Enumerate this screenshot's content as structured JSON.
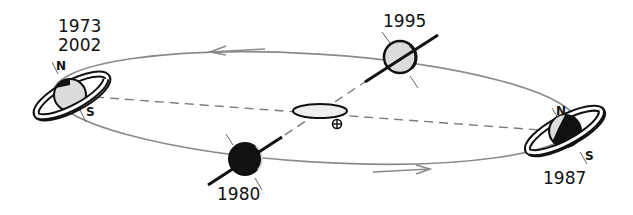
{
  "diagram": {
    "title": "",
    "colors": {
      "background": "#ffffff",
      "orbit": "#8a8a8a",
      "ink": "#111111",
      "planet_light": "#dcdcdc",
      "dash": "#7a7a7a"
    },
    "positions": [
      {
        "id": "left",
        "years": [
          "1973",
          "2002"
        ],
        "north_label": "N",
        "south_label": "S",
        "rings": "open"
      },
      {
        "id": "top",
        "years": [
          "1995"
        ],
        "rings": "edge-on"
      },
      {
        "id": "right",
        "years": [
          "1987"
        ],
        "north_label": "N",
        "south_label": "S",
        "rings": "open"
      },
      {
        "id": "bottom",
        "years": [
          "1980"
        ],
        "rings": "edge-on"
      }
    ],
    "center": {
      "sun": "sun-ellipse",
      "earth_symbol": "⊕"
    },
    "arrows": [
      {
        "id": "top-arrow",
        "direction": "left"
      },
      {
        "id": "bottom-arrow",
        "direction": "right"
      }
    ]
  }
}
